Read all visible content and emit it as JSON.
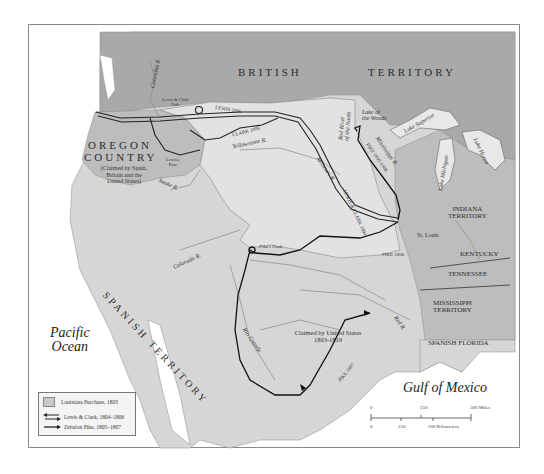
{
  "map": {
    "title": "Lewis and Clark and Zebulon Pike Expeditions",
    "regions": {
      "british_territory": [
        "BRITISH",
        "TERRITORY"
      ],
      "oregon_country": [
        "OREGON",
        "COUNTRY"
      ],
      "oregon_note": [
        "(Claimed by Spain,",
        "Britain and the",
        "United States)"
      ],
      "spanish_territory": "SPANISH TERRITORY",
      "indiana": [
        "INDIANA",
        "TERRITORY"
      ],
      "kentucky": "KENTUCKY",
      "tennessee": "TENNESSEE",
      "mississippi": [
        "MISSISSIPPI",
        "TERRITORY"
      ],
      "spanish_florida": "SPANISH FLORIDA",
      "claimed_us": [
        "Claimed by United States",
        "1803-1819"
      ]
    },
    "water": {
      "pacific": [
        "Pacific",
        "Ocean"
      ],
      "gulf": "Gulf of Mexico",
      "lake_superior": "Lake Superior",
      "lake_michigan": "Lake Michigan",
      "lake_huron": "Lake Huron",
      "lake_woods": [
        "Lake of",
        "the Woods"
      ]
    },
    "rivers": {
      "columbia": "Columbia R.",
      "snake": "Snake R.",
      "yellowstone": "Yellowstone R.",
      "missouri": "Missouri R.",
      "mississippi": "Mississippi R.",
      "red_north": [
        "Red River",
        "of the North"
      ],
      "colorado": "Colorado R.",
      "rio_grande": "Rio Grande",
      "red": "Red R."
    },
    "places": {
      "st_louis": "St. Louis",
      "pikes_peak": "Pike's Peak",
      "lewis_clark_path": [
        "Lewis & Clark",
        "Path"
      ],
      "lewis_pass": [
        "Lewis's",
        "Pass"
      ]
    },
    "route_labels": {
      "lewis_1806": "LEWIS 1806",
      "clark_1806": "CLARK 1806",
      "lewis_clark_1804": "LEWIS & CLARK 1804",
      "pike_1806": "PIKE 1806",
      "pike_1805": "PIKE 1805-1806",
      "pike_1807": "PIKE 1807"
    },
    "legend": {
      "items": [
        {
          "label": "Louisiana Purchase, 1803",
          "symbol": "gray-swatch"
        },
        {
          "label": "Lewis & Clark, 1804–1806",
          "symbol": "double-arrow"
        },
        {
          "label": "Zebulon Pike, 1805–1807",
          "symbol": "single-arrow"
        }
      ]
    },
    "scale": {
      "miles": [
        "0",
        "250",
        "500 Miles"
      ],
      "km": [
        "0",
        "250",
        "500 Kilometers"
      ]
    },
    "colors": {
      "louisiana": "#cfcfcf",
      "british": "#a8a8a8",
      "other_land": "#bdbdbd",
      "spanish": "#d6d6d6",
      "water": "#ffffff",
      "route": "#111111"
    }
  }
}
